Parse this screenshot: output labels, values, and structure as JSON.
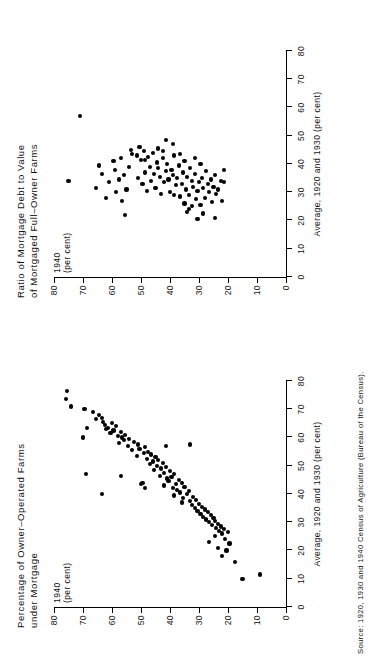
{
  "figure": {
    "source_note": "Source: 1920, 1930 and 1940 Census of Agriculture (Bureau of the Census).",
    "background_color": "#ffffff",
    "ink_color": "#000000",
    "orientation": "rotated-90-ccw"
  },
  "panels": [
    {
      "id": "left",
      "title": "Percentage of Owner–Operated Farms\n        under Mortgage",
      "ylabel": "1940\n(per cent)",
      "xlabel": "Average, 1920 and 1930 (per cent)"
    },
    {
      "id": "right",
      "title": "Ratio of Mortgage Debt to Value\n   of Mortgaged Full–Owner Farms",
      "ylabel": "1940\n(per cent)",
      "xlabel": "Average, 1920 and 1930 (per cent)"
    }
  ],
  "axis_ticks": {
    "x": [
      "0",
      "10",
      "20",
      "30",
      "40",
      "50",
      "60",
      "70",
      "80"
    ],
    "y": [
      "0",
      "10",
      "20",
      "30",
      "40",
      "50",
      "60",
      "70",
      "80"
    ]
  },
  "chart_data": [
    {
      "type": "scatter",
      "panel": "left",
      "title": "Percentage of Owner-Operated Farms under Mortgage",
      "xlabel": "Average, 1920 and 1930 (per cent)",
      "ylabel": "1940 (per cent)",
      "xlim": [
        0,
        80
      ],
      "ylim": [
        0,
        80
      ],
      "xticks": [
        0,
        10,
        20,
        30,
        40,
        50,
        60,
        70,
        80
      ],
      "yticks": [
        0,
        10,
        20,
        30,
        40,
        50,
        60,
        70,
        80
      ],
      "grid": false,
      "legend": null,
      "marker": "filled-circle",
      "points": [
        [
          76.5,
          75.5
        ],
        [
          73.5,
          76.0
        ],
        [
          71.0,
          74.0
        ],
        [
          70.0,
          69.5
        ],
        [
          69.0,
          66.5
        ],
        [
          68.0,
          64.5
        ],
        [
          67.0,
          63.5
        ],
        [
          66.5,
          65.5
        ],
        [
          65.5,
          63.0
        ],
        [
          65.0,
          60.0
        ],
        [
          64.5,
          62.5
        ],
        [
          64.0,
          58.5
        ],
        [
          63.5,
          61.5
        ],
        [
          63.0,
          62.0
        ],
        [
          62.5,
          59.5
        ],
        [
          62.0,
          57.0
        ],
        [
          61.5,
          60.5
        ],
        [
          61.0,
          55.5
        ],
        [
          60.5,
          58.0
        ],
        [
          60.0,
          56.5
        ],
        [
          59.5,
          54.0
        ],
        [
          59.0,
          56.0
        ],
        [
          58.5,
          52.5
        ],
        [
          58.0,
          57.5
        ],
        [
          57.5,
          51.0
        ],
        [
          57.0,
          54.5
        ],
        [
          56.5,
          48.5
        ],
        [
          56.0,
          50.5
        ],
        [
          55.5,
          53.0
        ],
        [
          55.0,
          47.5
        ],
        [
          54.5,
          49.0
        ],
        [
          54.0,
          46.5
        ],
        [
          53.5,
          51.5
        ],
        [
          53.0,
          45.0
        ],
        [
          52.5,
          48.0
        ],
        [
          52.0,
          44.0
        ],
        [
          51.5,
          46.0
        ],
        [
          51.0,
          42.5
        ],
        [
          50.5,
          47.0
        ],
        [
          50.0,
          44.5
        ],
        [
          49.5,
          41.5
        ],
        [
          49.0,
          43.0
        ],
        [
          48.5,
          45.5
        ],
        [
          48.0,
          40.0
        ],
        [
          47.5,
          42.0
        ],
        [
          47.0,
          38.5
        ],
        [
          46.5,
          43.5
        ],
        [
          46.0,
          39.5
        ],
        [
          45.5,
          41.0
        ],
        [
          45.0,
          37.0
        ],
        [
          44.5,
          40.5
        ],
        [
          44.0,
          36.0
        ],
        [
          43.5,
          38.0
        ],
        [
          43.0,
          42.0
        ],
        [
          42.5,
          35.0
        ],
        [
          42.0,
          39.0
        ],
        [
          41.5,
          37.5
        ],
        [
          41.0,
          33.5
        ],
        [
          40.5,
          36.5
        ],
        [
          40.0,
          34.0
        ],
        [
          39.5,
          38.5
        ],
        [
          39.0,
          32.0
        ],
        [
          38.5,
          35.5
        ],
        [
          38.0,
          31.0
        ],
        [
          37.5,
          33.0
        ],
        [
          37.0,
          36.0
        ],
        [
          36.5,
          30.0
        ],
        [
          36.0,
          32.5
        ],
        [
          35.5,
          29.0
        ],
        [
          35.0,
          31.5
        ],
        [
          34.5,
          28.0
        ],
        [
          34.0,
          30.5
        ],
        [
          33.5,
          27.0
        ],
        [
          33.0,
          29.5
        ],
        [
          32.5,
          26.0
        ],
        [
          32.0,
          28.5
        ],
        [
          31.5,
          25.0
        ],
        [
          31.0,
          27.5
        ],
        [
          30.5,
          24.5
        ],
        [
          30.0,
          26.5
        ],
        [
          29.5,
          23.5
        ],
        [
          29.0,
          25.5
        ],
        [
          28.5,
          22.5
        ],
        [
          28.0,
          24.0
        ],
        [
          27.5,
          21.5
        ],
        [
          27.0,
          23.0
        ],
        [
          26.5,
          20.0
        ],
        [
          26.0,
          22.0
        ],
        [
          25.0,
          24.5
        ],
        [
          24.0,
          21.0
        ],
        [
          23.0,
          26.5
        ],
        [
          22.5,
          19.5
        ],
        [
          21.0,
          23.5
        ],
        [
          20.0,
          20.5
        ],
        [
          18.0,
          22.0
        ],
        [
          16.0,
          17.5
        ],
        [
          11.5,
          9.0
        ],
        [
          10.0,
          15.0
        ],
        [
          57.0,
          41.5
        ],
        [
          57.5,
          33.0
        ],
        [
          60.0,
          70.0
        ],
        [
          63.5,
          68.5
        ],
        [
          47.0,
          69.0
        ],
        [
          40.0,
          63.5
        ],
        [
          46.5,
          57.0
        ],
        [
          44.0,
          49.5
        ],
        [
          43.5,
          50.0
        ],
        [
          42.0,
          48.5
        ]
      ]
    },
    {
      "type": "scatter",
      "panel": "right",
      "title": "Ratio of Mortgage Debt to Value of Mortgaged Full-Owner Farms",
      "xlabel": "Average, 1920 and 1930 (per cent)",
      "ylabel": "1940 (per cent)",
      "xlim": [
        0,
        80
      ],
      "ylim": [
        0,
        80
      ],
      "xticks": [
        0,
        10,
        20,
        30,
        40,
        50,
        60,
        70,
        80
      ],
      "yticks": [
        0,
        10,
        20,
        30,
        40,
        50,
        60,
        70,
        80
      ],
      "grid": false,
      "legend": null,
      "marker": "filled-circle",
      "points": [
        [
          34.0,
          75.0
        ],
        [
          57.0,
          71.0
        ],
        [
          31.5,
          65.5
        ],
        [
          39.5,
          64.5
        ],
        [
          36.5,
          63.5
        ],
        [
          28.0,
          62.0
        ],
        [
          33.5,
          61.0
        ],
        [
          41.0,
          59.5
        ],
        [
          38.0,
          59.0
        ],
        [
          30.0,
          58.5
        ],
        [
          34.5,
          57.5
        ],
        [
          42.0,
          57.0
        ],
        [
          27.0,
          56.5
        ],
        [
          36.0,
          56.0
        ],
        [
          22.0,
          55.5
        ],
        [
          31.0,
          55.0
        ],
        [
          39.0,
          54.0
        ],
        [
          43.5,
          53.0
        ],
        [
          43.0,
          51.5
        ],
        [
          35.0,
          51.0
        ],
        [
          46.0,
          50.5
        ],
        [
          41.5,
          50.0
        ],
        [
          33.0,
          49.5
        ],
        [
          44.5,
          49.0
        ],
        [
          37.0,
          48.5
        ],
        [
          30.5,
          48.0
        ],
        [
          42.5,
          47.5
        ],
        [
          39.0,
          47.0
        ],
        [
          34.0,
          46.5
        ],
        [
          44.0,
          46.0
        ],
        [
          36.5,
          45.5
        ],
        [
          31.5,
          45.0
        ],
        [
          40.5,
          44.5
        ],
        [
          38.5,
          44.0
        ],
        [
          35.5,
          43.5
        ],
        [
          29.5,
          43.0
        ],
        [
          42.0,
          42.5
        ],
        [
          33.5,
          42.0
        ],
        [
          37.5,
          41.5
        ],
        [
          40.0,
          41.0
        ],
        [
          34.5,
          40.5
        ],
        [
          30.0,
          40.0
        ],
        [
          38.0,
          39.5
        ],
        [
          36.0,
          39.0
        ],
        [
          43.0,
          38.5
        ],
        [
          32.5,
          38.0
        ],
        [
          35.0,
          37.5
        ],
        [
          39.5,
          37.0
        ],
        [
          28.5,
          36.5
        ],
        [
          33.0,
          36.0
        ],
        [
          37.0,
          35.5
        ],
        [
          41.0,
          35.0
        ],
        [
          31.0,
          34.5
        ],
        [
          35.5,
          34.0
        ],
        [
          29.0,
          33.5
        ],
        [
          38.5,
          33.0
        ],
        [
          34.0,
          32.5
        ],
        [
          32.0,
          32.0
        ],
        [
          36.5,
          31.5
        ],
        [
          27.5,
          31.0
        ],
        [
          30.5,
          30.5
        ],
        [
          33.5,
          30.0
        ],
        [
          40.0,
          29.5
        ],
        [
          35.0,
          29.0
        ],
        [
          31.5,
          28.5
        ],
        [
          28.0,
          28.0
        ],
        [
          37.5,
          27.5
        ],
        [
          33.0,
          27.0
        ],
        [
          30.0,
          26.5
        ],
        [
          34.5,
          26.0
        ],
        [
          26.5,
          25.5
        ],
        [
          32.0,
          25.0
        ],
        [
          36.0,
          24.5
        ],
        [
          29.5,
          24.0
        ],
        [
          31.0,
          23.5
        ],
        [
          34.0,
          22.5
        ],
        [
          48.5,
          41.5
        ],
        [
          44.5,
          42.5
        ],
        [
          24.0,
          33.5
        ],
        [
          25.0,
          32.5
        ],
        [
          23.0,
          34.0
        ],
        [
          20.5,
          30.5
        ],
        [
          22.5,
          28.5
        ],
        [
          21.0,
          24.5
        ],
        [
          27.0,
          22.0
        ],
        [
          25.5,
          29.5
        ],
        [
          26.0,
          35.0
        ],
        [
          29.0,
          38.5
        ],
        [
          45.5,
          44.0
        ],
        [
          47.0,
          39.0
        ],
        [
          43.5,
          36.5
        ],
        [
          42.0,
          31.5
        ],
        [
          38.0,
          21.5
        ],
        [
          33.5,
          21.5
        ],
        [
          41.5,
          48.5
        ],
        [
          45.0,
          53.5
        ]
      ]
    }
  ]
}
